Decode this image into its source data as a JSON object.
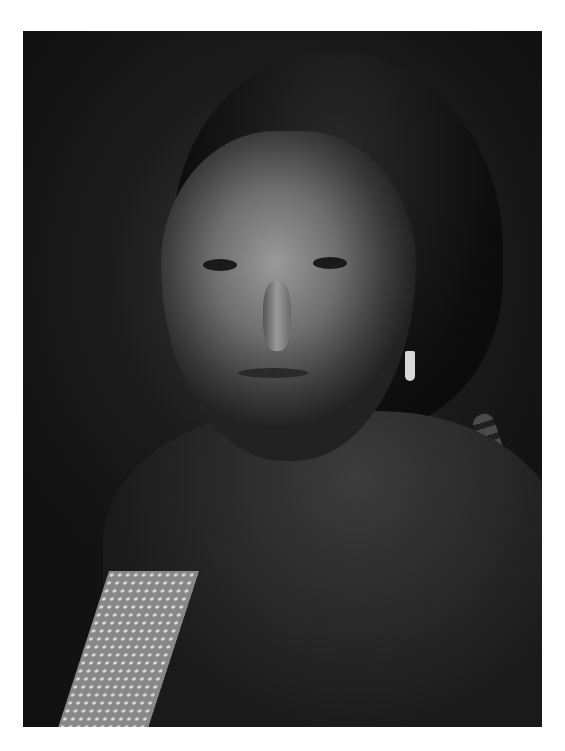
{
  "image": {
    "description": "Black-and-white portrait photograph of a woman with center-parted dark hair, dangling earring, dark wrapped garment and patterned blanket at lower left",
    "colors": {
      "background": "#ffffff",
      "photo_dark": "#121212",
      "face_mid": "#9a9a9a"
    }
  }
}
